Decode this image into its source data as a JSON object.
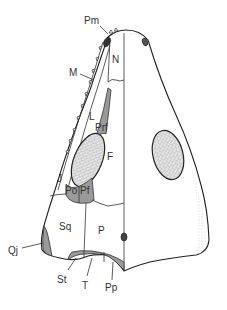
{
  "diagram": {
    "colors": {
      "outline": "#222222",
      "shaded_bone": "#9a9a9a",
      "stipple": "#bdbdbd",
      "background": "#ffffff"
    },
    "labels": {
      "pm": "Pm",
      "m": "M",
      "n": "N",
      "l": "L",
      "prf": "Prf",
      "f": "F",
      "j": "J",
      "po": "Po",
      "pf": "Pf",
      "sq": "Sq",
      "p": "P",
      "qj": "Qj",
      "st": "St",
      "t": "T",
      "pp": "Pp"
    }
  }
}
